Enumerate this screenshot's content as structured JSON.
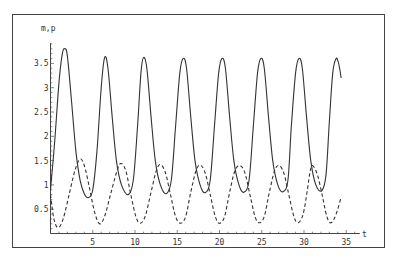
{
  "chart_data": {
    "type": "line",
    "title": "",
    "xlabel": "t",
    "ylabel": "m,p",
    "xlim": [
      0,
      35
    ],
    "ylim": [
      0,
      3.9
    ],
    "grid": false,
    "legend": null,
    "x_ticks": [
      5,
      10,
      15,
      20,
      25,
      30,
      35
    ],
    "x_tick_labels": [
      "5",
      "10",
      "15",
      "20",
      "25",
      "30",
      "35"
    ],
    "y_ticks": [
      0.5,
      1,
      1.5,
      2,
      2.5,
      3,
      3.5
    ],
    "y_tick_labels": [
      "0.5",
      "1",
      "1.5",
      "2",
      "2.5",
      "3",
      "3.5"
    ],
    "series": [
      {
        "name": "m",
        "style": "solid",
        "color": "#333333",
        "points": [
          [
            0,
            0.9
          ],
          [
            0.5,
            1.9
          ],
          [
            1.0,
            3.1
          ],
          [
            1.4,
            3.7
          ],
          [
            1.7,
            3.8
          ],
          [
            2.0,
            3.65
          ],
          [
            2.5,
            2.7
          ],
          [
            3.0,
            1.7
          ],
          [
            3.5,
            1.1
          ],
          [
            4.0,
            0.82
          ],
          [
            4.5,
            0.74
          ],
          [
            5.0,
            0.9
          ],
          [
            5.5,
            1.7
          ],
          [
            6.0,
            3.0
          ],
          [
            6.4,
            3.62
          ],
          [
            6.8,
            3.4
          ],
          [
            7.3,
            2.4
          ],
          [
            7.8,
            1.5
          ],
          [
            8.4,
            1.0
          ],
          [
            9.2,
            0.8
          ],
          [
            9.8,
            1.1
          ],
          [
            10.3,
            2.2
          ],
          [
            10.7,
            3.3
          ],
          [
            11.0,
            3.62
          ],
          [
            11.4,
            3.4
          ],
          [
            11.9,
            2.4
          ],
          [
            12.4,
            1.5
          ],
          [
            13.0,
            1.0
          ],
          [
            13.7,
            0.82
          ],
          [
            14.3,
            1.1
          ],
          [
            14.8,
            2.2
          ],
          [
            15.3,
            3.3
          ],
          [
            15.7,
            3.6
          ],
          [
            16.1,
            3.4
          ],
          [
            16.6,
            2.4
          ],
          [
            17.1,
            1.5
          ],
          [
            17.7,
            1.0
          ],
          [
            18.3,
            0.84
          ],
          [
            18.9,
            1.1
          ],
          [
            19.4,
            2.2
          ],
          [
            19.9,
            3.3
          ],
          [
            20.3,
            3.6
          ],
          [
            20.7,
            3.4
          ],
          [
            21.2,
            2.4
          ],
          [
            21.7,
            1.5
          ],
          [
            22.3,
            1.0
          ],
          [
            22.9,
            0.85
          ],
          [
            23.5,
            1.1
          ],
          [
            24.0,
            2.2
          ],
          [
            24.5,
            3.3
          ],
          [
            24.9,
            3.6
          ],
          [
            25.3,
            3.4
          ],
          [
            25.8,
            2.4
          ],
          [
            26.3,
            1.5
          ],
          [
            26.9,
            1.0
          ],
          [
            27.5,
            0.86
          ],
          [
            28.1,
            1.1
          ],
          [
            28.5,
            2.2
          ],
          [
            29.0,
            3.3
          ],
          [
            29.4,
            3.6
          ],
          [
            29.8,
            3.4
          ],
          [
            30.3,
            2.4
          ],
          [
            30.8,
            1.5
          ],
          [
            31.4,
            1.0
          ],
          [
            32.1,
            0.88
          ],
          [
            32.6,
            1.2
          ],
          [
            33.0,
            2.3
          ],
          [
            33.4,
            3.3
          ],
          [
            33.8,
            3.6
          ],
          [
            34.1,
            3.5
          ],
          [
            34.4,
            3.2
          ]
        ]
      },
      {
        "name": "p",
        "style": "dashed",
        "color": "#333333",
        "points": [
          [
            0,
            0.8
          ],
          [
            0.4,
            0.3
          ],
          [
            0.9,
            0.12
          ],
          [
            1.5,
            0.3
          ],
          [
            2.2,
            0.8
          ],
          [
            2.9,
            1.3
          ],
          [
            3.5,
            1.53
          ],
          [
            4.0,
            1.4
          ],
          [
            4.6,
            0.95
          ],
          [
            5.2,
            0.45
          ],
          [
            5.8,
            0.2
          ],
          [
            6.4,
            0.35
          ],
          [
            7.1,
            0.8
          ],
          [
            7.8,
            1.25
          ],
          [
            8.3,
            1.44
          ],
          [
            8.9,
            1.3
          ],
          [
            9.5,
            0.8
          ],
          [
            10.1,
            0.35
          ],
          [
            10.6,
            0.21
          ],
          [
            11.2,
            0.35
          ],
          [
            11.9,
            0.85
          ],
          [
            12.5,
            1.28
          ],
          [
            13.0,
            1.42
          ],
          [
            13.6,
            1.25
          ],
          [
            14.2,
            0.8
          ],
          [
            14.8,
            0.35
          ],
          [
            15.4,
            0.21
          ],
          [
            16.0,
            0.35
          ],
          [
            16.6,
            0.85
          ],
          [
            17.2,
            1.28
          ],
          [
            17.7,
            1.41
          ],
          [
            18.3,
            1.25
          ],
          [
            18.9,
            0.8
          ],
          [
            19.5,
            0.35
          ],
          [
            20.0,
            0.21
          ],
          [
            20.6,
            0.35
          ],
          [
            21.2,
            0.85
          ],
          [
            21.8,
            1.28
          ],
          [
            22.4,
            1.4
          ],
          [
            23.0,
            1.25
          ],
          [
            23.6,
            0.8
          ],
          [
            24.2,
            0.35
          ],
          [
            24.7,
            0.22
          ],
          [
            25.3,
            0.35
          ],
          [
            25.9,
            0.85
          ],
          [
            26.5,
            1.28
          ],
          [
            27.0,
            1.4
          ],
          [
            27.6,
            1.25
          ],
          [
            28.2,
            0.8
          ],
          [
            28.8,
            0.35
          ],
          [
            29.3,
            0.22
          ],
          [
            29.9,
            0.4
          ],
          [
            30.4,
            0.9
          ],
          [
            30.7,
            1.25
          ],
          [
            31.0,
            1.4
          ],
          [
            31.6,
            1.2
          ],
          [
            32.2,
            0.75
          ],
          [
            32.7,
            0.35
          ],
          [
            33.2,
            0.22
          ],
          [
            33.8,
            0.4
          ],
          [
            34.4,
            0.75
          ]
        ]
      }
    ]
  },
  "axes": {
    "x_label": "t",
    "y_label": "m,p"
  }
}
